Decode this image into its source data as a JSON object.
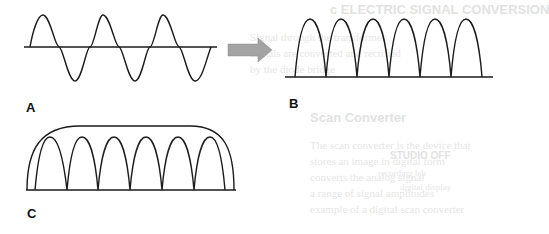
{
  "figure": {
    "panels": [
      {
        "id": "A",
        "label": "A",
        "description": "AC sine wave"
      },
      {
        "id": "B",
        "label": "B",
        "description": "Full-wave rectified output"
      },
      {
        "id": "C",
        "label": "C",
        "description": "Rectified output with smoothing envelope"
      }
    ],
    "arrow": {
      "color": "#a0a0a0",
      "direction": "right"
    },
    "stroke_color": "#1a1a1a"
  },
  "background_bleed": {
    "lines": [
      "c ELECTRIC SIGNAL CONVERSION",
      "Signal through the transformer",
      "signals are converted and rectified",
      "by the diode bridge",
      "Scan Converter",
      "The scan converter is the device that",
      "stores an image in digital form",
      "converts the analog signal",
      "a range of signal amplitudes",
      "example of a digital scan converter",
      "STUDIO OFF",
      "recording lab",
      "digital display"
    ]
  }
}
